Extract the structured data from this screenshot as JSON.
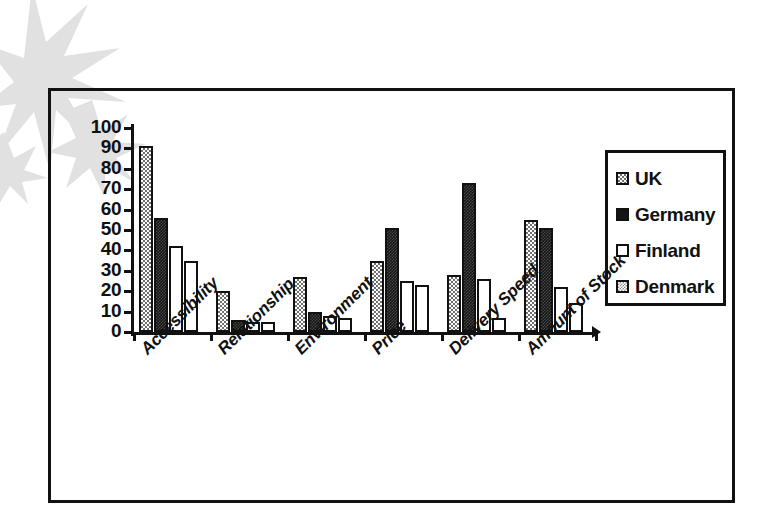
{
  "chart_data": {
    "type": "bar",
    "title": "",
    "subtitle": "",
    "xlabel": "",
    "ylabel": "",
    "ylim": [
      0,
      100
    ],
    "yticks": [
      0,
      10,
      20,
      30,
      40,
      50,
      60,
      70,
      80,
      90,
      100
    ],
    "grid": false,
    "legend_position": "right",
    "categories": [
      "Accessibility",
      "Relationship",
      "Environment",
      "Price",
      "Delivery Speed",
      "Amount of Stock"
    ],
    "series": [
      {
        "name": "UK",
        "values": [
          91,
          20,
          27,
          35,
          28,
          55
        ]
      },
      {
        "name": "Germany",
        "values": [
          56,
          6,
          10,
          51,
          73,
          51
        ]
      },
      {
        "name": "Finland",
        "values": [
          42,
          5,
          8,
          25,
          26,
          22
        ]
      },
      {
        "name": "Denmark",
        "values": [
          35,
          5,
          7,
          23,
          7,
          14
        ]
      }
    ]
  },
  "legend": {
    "entries": [
      {
        "label": "UK"
      },
      {
        "label": "Germany"
      },
      {
        "label": "Finland"
      },
      {
        "label": "Denmark"
      }
    ]
  },
  "colors": {
    "axis": "#111111",
    "frame": "#111111",
    "background": "#ffffff",
    "series_uk": "#6f6f6f",
    "series_germany": "#151515",
    "series_finland": "#ffffff",
    "series_denmark": "#ffffff"
  }
}
